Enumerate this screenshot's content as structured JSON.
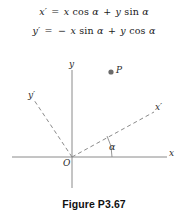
{
  "figure": {
    "caption": "Figure P3.67",
    "equations": [
      {
        "id": "x-prime-equation",
        "lhs": "x′",
        "relation": "=",
        "rhs": "x cos α + y sin α",
        "full": "x′ = x cos α + y sin α",
        "parts": {
          "lhs_var": "x",
          "lhs_prime": "′",
          "equals": "=",
          "term1_var": "x",
          "term1_fn": "cos",
          "term1_angle": "α",
          "plus": "+",
          "term2_var": "y",
          "term2_fn": "sin",
          "term2_angle": "α"
        }
      },
      {
        "id": "y-prime-equation",
        "lhs": "y′",
        "relation": "=",
        "rhs": "− x sin α + y cos α",
        "full": "y′ = − x sin α + y cos α",
        "parts": {
          "lhs_var": "y",
          "lhs_prime": "′",
          "equals": "=",
          "minus": "−",
          "term1_var": "x",
          "term1_fn": "sin",
          "term1_angle": "α",
          "plus": "+",
          "term2_var": "y",
          "term2_fn": "cos",
          "term2_angle": "α"
        }
      }
    ],
    "diagram": {
      "axis_labels": {
        "x": "x",
        "y": "y",
        "x_prime": "x′",
        "y_prime": "y′",
        "origin": "O"
      },
      "point": {
        "label": "P",
        "marker": "filled-dot"
      },
      "angle": {
        "label": "α",
        "between": "x-axis and x-prime-axis",
        "degrees": 28
      },
      "geometry": {
        "origin_px": [
          72,
          102
        ],
        "x_axis": [
          [
            12,
            102
          ],
          [
            167,
            102
          ]
        ],
        "y_axis": [
          [
            72,
            15
          ],
          [
            72,
            133
          ]
        ],
        "x_prime_axis": [
          [
            72,
            102
          ],
          [
            154,
            57
          ]
        ],
        "y_prime_axis": [
          [
            72,
            102
          ],
          [
            34,
            45
          ]
        ],
        "point_P_px": [
          111,
          17
        ]
      },
      "style": {
        "solid_axis_color": "#8a8a8a",
        "dashed_axis_color": "#8a8a8a",
        "point_color": "#6b6b6b",
        "arc_color": "#8a8a8a",
        "dash_pattern": "4 3"
      }
    }
  }
}
